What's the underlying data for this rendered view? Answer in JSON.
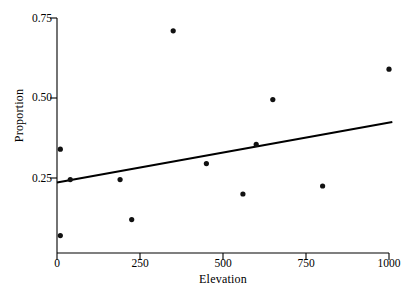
{
  "figure": {
    "background_color": "#ffffff",
    "ink_color": "#000000"
  },
  "axes": {
    "x_label": "Elevation",
    "y_label": "Proportion",
    "x_ticks": [
      "0",
      "250",
      "500",
      "750",
      "1000"
    ],
    "y_ticks": [
      "0.25",
      "0.50",
      "0.75"
    ]
  },
  "chart_data": {
    "type": "scatter",
    "title": "",
    "xlabel": "Elevation",
    "ylabel": "Proportion",
    "xlim": [
      -20,
      1030
    ],
    "ylim": [
      0.02,
      0.78
    ],
    "xticks": [
      0,
      250,
      500,
      750,
      1000
    ],
    "yticks": [
      0.25,
      0.5,
      0.75
    ],
    "grid": false,
    "legend": null,
    "points": [
      {
        "x": 10,
        "y": 0.34
      },
      {
        "x": 10,
        "y": 0.07
      },
      {
        "x": 40,
        "y": 0.245
      },
      {
        "x": 190,
        "y": 0.245
      },
      {
        "x": 225,
        "y": 0.12
      },
      {
        "x": 350,
        "y": 0.71
      },
      {
        "x": 450,
        "y": 0.295
      },
      {
        "x": 560,
        "y": 0.2
      },
      {
        "x": 600,
        "y": 0.355
      },
      {
        "x": 650,
        "y": 0.495
      },
      {
        "x": 800,
        "y": 0.225
      },
      {
        "x": 1000,
        "y": 0.59
      }
    ],
    "fit_line": {
      "type": "linear",
      "x_start": 0,
      "y_start": 0.236,
      "x_end": 1010,
      "y_end": 0.425
    }
  }
}
